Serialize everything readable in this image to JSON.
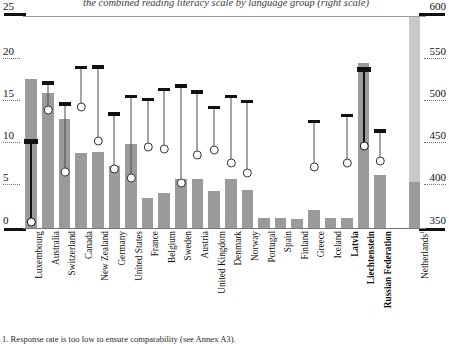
{
  "title": "the combined reading literacy scale by language group (right scale)",
  "footnote": "1. Response rate is too low to ensure comparability (see Annex A3).",
  "axes": {
    "left": {
      "label": "",
      "min": 0,
      "max": 25,
      "ticks": [
        "0",
        "5",
        "10",
        "15",
        "20",
        "25"
      ]
    },
    "right": {
      "label": "",
      "min": 350,
      "max": 600,
      "ticks": [
        "350",
        "400",
        "450",
        "500",
        "550",
        "600"
      ]
    }
  },
  "chart_data": {
    "type": "bar",
    "title": "the combined reading literacy scale by language group (right scale)",
    "xlabel": "",
    "ylabel": "",
    "ylim": [
      0,
      25
    ],
    "y2lim": [
      350,
      600
    ],
    "grid": false,
    "legend": "none",
    "categories": [
      "Luxembourg",
      "Australia",
      "Switzerland",
      "Canada",
      "New Zealand",
      "Germany",
      "United States",
      "France",
      "Belgium",
      "Sweden",
      "Austria",
      "United Kingdom",
      "Denmark",
      "Norway",
      "Portugal",
      "Spain",
      "Finland",
      "Greece",
      "Iceland",
      "Latvia",
      "Liechtenstein",
      "Russian Federation",
      "Netherlands1"
    ],
    "series": [
      {
        "name": "Percentage of students (left scale)",
        "axis": "left",
        "values": [
          17.7,
          16.0,
          12.9,
          8.9,
          9.0,
          7.3,
          9.9,
          3.6,
          4.2,
          5.8,
          5.8,
          4.4,
          5.8,
          4.5,
          1.2,
          1.2,
          1.1,
          2.1,
          1.2,
          1.2,
          19.5,
          6.3,
          5.4
        ]
      },
      {
        "name": "Reading literacy score, higher language group (right scale)",
        "axis": "right",
        "values": [
          452,
          522,
          497,
          540,
          541,
          485,
          506,
          502,
          514,
          518,
          511,
          493,
          506,
          500,
          null,
          null,
          null,
          476,
          null,
          483,
          537,
          465,
          null
        ]
      },
      {
        "name": "Reading literacy score, lower language group (right scale)",
        "axis": "right",
        "values": [
          360,
          493,
          419,
          496,
          456,
          423,
          412,
          449,
          446,
          406,
          439,
          445,
          430,
          418,
          null,
          null,
          null,
          425,
          null,
          430,
          450,
          432,
          null
        ]
      }
    ],
    "highlighted": [
      "Luxembourg",
      "Liechtenstein"
    ],
    "separate_panel": [
      "Netherlands1"
    ]
  },
  "marks": {
    "dash": "range-high-marker",
    "circle": "range-low-marker",
    "bar": "percentage-bar"
  }
}
